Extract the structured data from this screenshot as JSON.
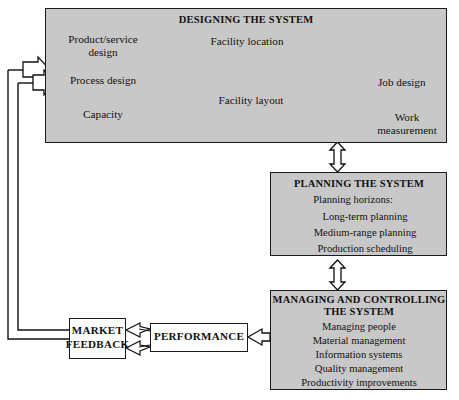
{
  "diagram": {
    "colors": {
      "box_fill": "#c8c8c8",
      "plain_box_fill": "#ffffff",
      "stroke": "#1a1a1a",
      "text": "#111111",
      "page_background": "#ffffff"
    }
  },
  "designing": {
    "title": "DESIGNING THE SYSTEM",
    "nodes": {
      "product_service_design_line1": "Product/service",
      "product_service_design_line2": "design",
      "process_design": "Process design",
      "capacity": "Capacity",
      "facility_location": "Facility location",
      "facility_layout": "Facility layout",
      "job_design": "Job design",
      "work_measurement_line1": "Work",
      "work_measurement_line2": "measurement"
    }
  },
  "planning": {
    "title": "PLANNING THE SYSTEM",
    "heading": "Planning horizons:",
    "items": [
      "Long-term planning",
      "Medium-range planning",
      "Production scheduling"
    ]
  },
  "managing": {
    "title_line1": "MANAGING AND CONTROLLING",
    "title_line2": "THE SYSTEM",
    "items": [
      "Managing people",
      "Material management",
      "Information systems",
      "Quality management",
      "Productivity improvements"
    ]
  },
  "market_feedback": {
    "line1": "MARKET",
    "line2": "FEEDBACK"
  },
  "performance": {
    "label": "PERFORMANCE"
  },
  "connectors": {
    "design_to_planning": "double-headed-block-arrow-vertical",
    "planning_to_managing": "double-headed-block-arrow-vertical",
    "managing_to_performance": "block-arrow-left",
    "performance_to_market_feedback": "double-arrow-left",
    "market_feedback_to_designing": "two-block-arrows-right"
  }
}
